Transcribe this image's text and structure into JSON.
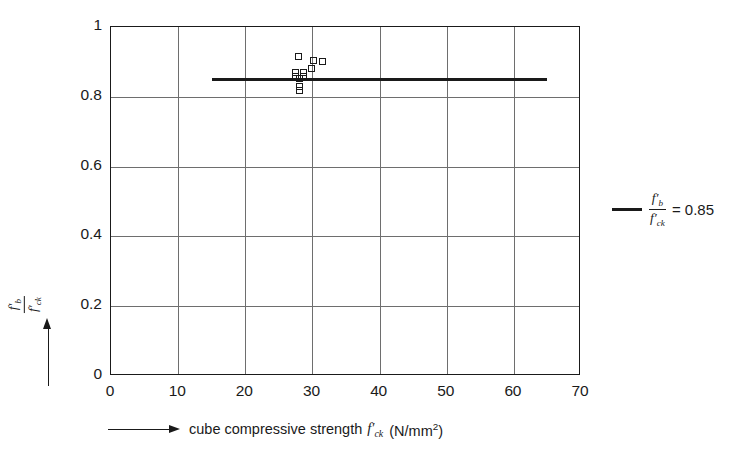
{
  "chart_data": {
    "type": "scatter",
    "title": "",
    "xlabel": "cube compressive strength f'ck (N/mm2)",
    "ylabel": "f'b / f'ck",
    "xlim": [
      0,
      70
    ],
    "ylim": [
      0,
      1
    ],
    "grid": true,
    "xticks": [
      0,
      10,
      20,
      30,
      40,
      50,
      60,
      70
    ],
    "yticks": [
      0,
      0.2,
      0.4,
      0.6,
      0.8,
      1
    ],
    "xtick_labels": [
      "0",
      "10",
      "20",
      "30",
      "40",
      "50",
      "60",
      "70"
    ],
    "ytick_labels": [
      "0",
      "0.2",
      "0.4",
      "0.6",
      "0.8",
      "1"
    ],
    "series": [
      {
        "name": "measured ratio f'b/f'ck",
        "marker": "open-square",
        "points": [
          {
            "x": 28.1,
            "y": 0.913
          },
          {
            "x": 30.3,
            "y": 0.9
          },
          {
            "x": 31.6,
            "y": 0.898
          },
          {
            "x": 30.0,
            "y": 0.878
          },
          {
            "x": 27.6,
            "y": 0.866
          },
          {
            "x": 28.8,
            "y": 0.866
          },
          {
            "x": 27.6,
            "y": 0.855
          },
          {
            "x": 28.8,
            "y": 0.855
          },
          {
            "x": 28.2,
            "y": 0.849
          },
          {
            "x": 28.2,
            "y": 0.828
          },
          {
            "x": 28.2,
            "y": 0.816
          }
        ]
      }
    ],
    "reference_line": {
      "label": "f'b / f'ck = 0.85",
      "value": 0.85,
      "x_start": 15,
      "x_end": 65
    },
    "legend_position": "right-outside"
  },
  "axes": {
    "x": {
      "arrow": "arrow-right",
      "label_prefix": "cube compressive strength",
      "symbol_f": "f",
      "symbol_sub": "ck",
      "units": "(N/mm",
      "units_sup": "2",
      "units_close": ")"
    },
    "y": {
      "arrow": "arrow-up",
      "numerator_f": "f",
      "numerator_sub": "b",
      "denominator_f": "f",
      "denominator_sub": "ck"
    }
  },
  "legend": {
    "swatch": "solid-line-swatch",
    "numerator_f": "f",
    "numerator_sub": "b",
    "denominator_f": "f",
    "denominator_sub": "ck",
    "equals_value": "= 0.85"
  },
  "colors": {
    "ink": "#1a1a1a",
    "grid": "#6e6e6e",
    "background": "#ffffff"
  }
}
